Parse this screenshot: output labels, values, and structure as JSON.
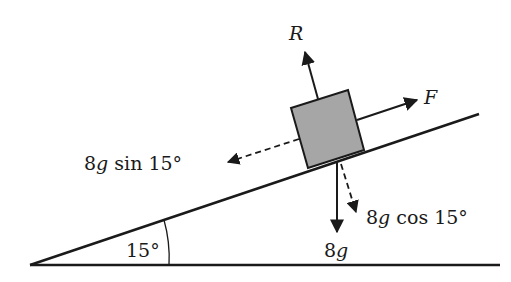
{
  "diagram": {
    "type": "inclined-plane-force-diagram",
    "colors": {
      "line": "#1a1a1a",
      "block_fill": "#a6a6a6",
      "background": "#ffffff"
    },
    "incline": {
      "angle_label": "15°"
    },
    "block": {
      "description": "block on incline"
    },
    "forces": {
      "normal": {
        "label": "R",
        "style": "solid"
      },
      "applied": {
        "label": "F",
        "style": "solid"
      },
      "weight": {
        "label_num": "8",
        "label_var": "g",
        "style": "solid"
      },
      "parallel_component": {
        "label_num": "8",
        "label_var": "g",
        "label_fn": " sin 15°",
        "style": "dashed"
      },
      "perpendicular_component": {
        "label_num": "8",
        "label_var": "g",
        "label_fn": " cos 15°",
        "style": "dashed"
      }
    }
  }
}
